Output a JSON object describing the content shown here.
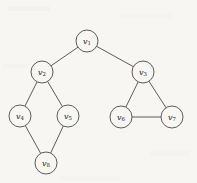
{
  "figure": {
    "kind": "undirected-graph-diagram",
    "background_color": "#f7f6f2",
    "stroke_color": "#4a4a48",
    "label_color": "#23231f",
    "node_radius": 11,
    "width": 197,
    "height": 183
  },
  "nodes": [
    {
      "id": "v1",
      "base": "v",
      "subscript": "1",
      "label": "v1",
      "cx": 87,
      "cy": 41
    },
    {
      "id": "v2",
      "base": "v",
      "subscript": "2",
      "label": "v2",
      "cx": 42,
      "cy": 72
    },
    {
      "id": "v3",
      "base": "v",
      "subscript": "3",
      "label": "v3",
      "cx": 143,
      "cy": 72
    },
    {
      "id": "v4",
      "base": "v",
      "subscript": "4",
      "label": "v4",
      "cx": 20,
      "cy": 116
    },
    {
      "id": "v5",
      "base": "v",
      "subscript": "5",
      "label": "v5",
      "cx": 68,
      "cy": 116
    },
    {
      "id": "v6",
      "base": "v",
      "subscript": "6",
      "label": "v6",
      "cx": 121,
      "cy": 117
    },
    {
      "id": "v7",
      "base": "v",
      "subscript": "7",
      "label": "v7",
      "cx": 172,
      "cy": 117
    },
    {
      "id": "v8",
      "base": "v",
      "subscript": "8",
      "label": "v8",
      "cx": 46,
      "cy": 163
    }
  ],
  "edges": [
    {
      "from": "v1",
      "to": "v2"
    },
    {
      "from": "v1",
      "to": "v3"
    },
    {
      "from": "v2",
      "to": "v4"
    },
    {
      "from": "v2",
      "to": "v5"
    },
    {
      "from": "v4",
      "to": "v8"
    },
    {
      "from": "v5",
      "to": "v8"
    },
    {
      "from": "v3",
      "to": "v6"
    },
    {
      "from": "v3",
      "to": "v7"
    },
    {
      "from": "v6",
      "to": "v7"
    }
  ]
}
